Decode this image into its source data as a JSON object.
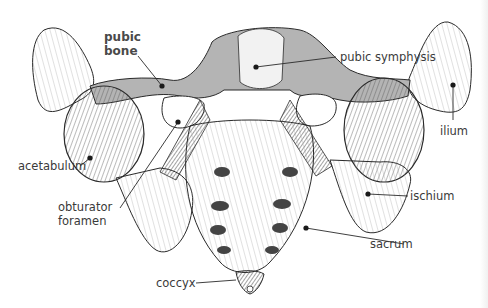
{
  "figure": {
    "labels": [
      {
        "id": "pubic-bone",
        "text_lines": [
          "pubic",
          "bone"
        ],
        "bold": true
      },
      {
        "id": "pubic-symphysis",
        "text": "pubic symphysis"
      },
      {
        "id": "ilium",
        "text": "ilium"
      },
      {
        "id": "acetabulum",
        "text": "acetabulum"
      },
      {
        "id": "obturator-foramen",
        "text_lines": [
          "obturator",
          "foramen"
        ]
      },
      {
        "id": "ischium",
        "text": "ischium"
      },
      {
        "id": "sacrum",
        "text": "sacrum"
      },
      {
        "id": "coccyx",
        "text": "coccyx"
      }
    ],
    "colors": {
      "line": "#2a2a2a",
      "bone_shade": "#b4b4b4",
      "bone_light": "#f2f2f2",
      "label_text": "#3a3a3a",
      "background": "#ffffff"
    }
  }
}
